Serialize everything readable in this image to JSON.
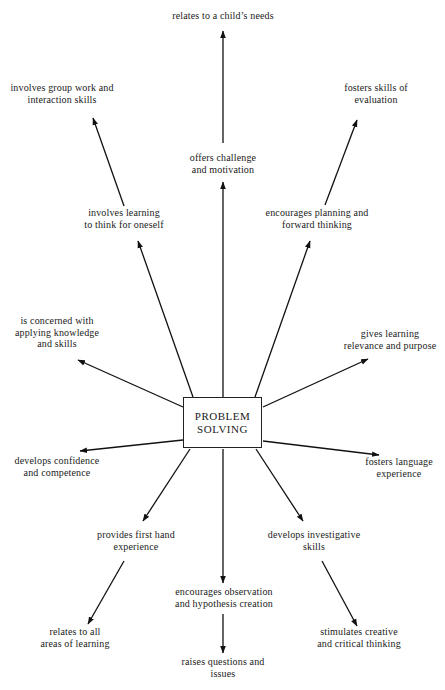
{
  "center": {
    "lines": [
      "PROBLEM",
      "SOLVING"
    ]
  },
  "nodes": [
    {
      "id": "childs-needs",
      "lines": [
        "relates to a child’s needs"
      ],
      "x": 223,
      "y": 15
    },
    {
      "id": "challenge",
      "lines": [
        "offers challenge",
        "and motivation"
      ],
      "x": 223,
      "y": 157
    },
    {
      "id": "group-work",
      "lines": [
        "involves group work and",
        "interaction skills"
      ],
      "x": 62,
      "y": 87
    },
    {
      "id": "think-oneself",
      "lines": [
        "involves learning",
        "to think for oneself"
      ],
      "x": 124,
      "y": 212
    },
    {
      "id": "evaluation",
      "lines": [
        "fosters skills of",
        "evaluation"
      ],
      "x": 376,
      "y": 87
    },
    {
      "id": "planning",
      "lines": [
        "encourages planning and",
        "forward thinking"
      ],
      "x": 317,
      "y": 212
    },
    {
      "id": "applying",
      "lines": [
        "is concerned with",
        "applying knowledge",
        "and skills"
      ],
      "x": 57,
      "y": 320
    },
    {
      "id": "relevance",
      "lines": [
        "gives learning",
        "relevance and purpose"
      ],
      "x": 390,
      "y": 333
    },
    {
      "id": "confidence",
      "lines": [
        "develops confidence",
        "and competence"
      ],
      "x": 57,
      "y": 460
    },
    {
      "id": "language",
      "lines": [
        "fosters language",
        "experience"
      ],
      "x": 399,
      "y": 461
    },
    {
      "id": "first-hand",
      "lines": [
        "provides first hand",
        "experience"
      ],
      "x": 136,
      "y": 534
    },
    {
      "id": "investigative",
      "lines": [
        "develops investigative",
        "skills"
      ],
      "x": 314,
      "y": 534
    },
    {
      "id": "observation",
      "lines": [
        "encourages observation",
        "and hypothesis creation"
      ],
      "x": 224,
      "y": 591
    },
    {
      "id": "all-areas",
      "lines": [
        "relates to all",
        "areas of learning"
      ],
      "x": 75,
      "y": 631
    },
    {
      "id": "questions",
      "lines": [
        "raises questions and",
        "issues"
      ],
      "x": 223,
      "y": 661
    },
    {
      "id": "creative",
      "lines": [
        "stimulates creative",
        "and critical thinking"
      ],
      "x": 359,
      "y": 631
    }
  ],
  "arrows": [
    {
      "from": "challenge",
      "to": "childs-needs",
      "x1": 223,
      "y1": 143,
      "x2": 223,
      "y2": 31
    },
    {
      "from": "center",
      "to": "challenge",
      "x1": 223,
      "y1": 397,
      "x2": 223,
      "y2": 182
    },
    {
      "from": "think-oneself",
      "to": "group-work",
      "x1": 124,
      "y1": 206,
      "x2": 93,
      "y2": 118
    },
    {
      "from": "center",
      "to": "think-oneself",
      "x1": 193,
      "y1": 397,
      "x2": 138,
      "y2": 241
    },
    {
      "from": "planning",
      "to": "evaluation",
      "x1": 325,
      "y1": 205,
      "x2": 357,
      "y2": 120
    },
    {
      "from": "center",
      "to": "planning",
      "x1": 255,
      "y1": 397,
      "x2": 310,
      "y2": 241
    },
    {
      "from": "center",
      "to": "applying",
      "x1": 183,
      "y1": 407,
      "x2": 78,
      "y2": 360
    },
    {
      "from": "center",
      "to": "relevance",
      "x1": 263,
      "y1": 407,
      "x2": 368,
      "y2": 359
    },
    {
      "from": "center",
      "to": "confidence",
      "x1": 183,
      "y1": 440,
      "x2": 80,
      "y2": 451
    },
    {
      "from": "center",
      "to": "language",
      "x1": 263,
      "y1": 441,
      "x2": 379,
      "y2": 455
    },
    {
      "from": "center",
      "to": "first-hand",
      "x1": 190,
      "y1": 449,
      "x2": 143,
      "y2": 521
    },
    {
      "from": "center",
      "to": "investigative",
      "x1": 256,
      "y1": 449,
      "x2": 303,
      "y2": 521
    },
    {
      "from": "center",
      "to": "observation",
      "x1": 223,
      "y1": 449,
      "x2": 223,
      "y2": 583
    },
    {
      "from": "first-hand",
      "to": "all-areas",
      "x1": 124,
      "y1": 561,
      "x2": 88,
      "y2": 624
    },
    {
      "from": "observation",
      "to": "questions",
      "x1": 223,
      "y1": 614,
      "x2": 223,
      "y2": 653
    },
    {
      "from": "investigative",
      "to": "creative",
      "x1": 322,
      "y1": 561,
      "x2": 357,
      "y2": 626
    }
  ],
  "colors": {
    "line": "#111111",
    "text": "#1a1a1a",
    "background": "#ffffff"
  }
}
